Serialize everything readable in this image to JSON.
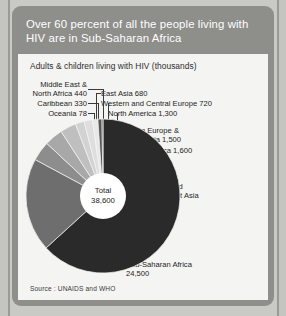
{
  "card": {
    "title": "Over 60 percent of all the people living with HIV are in Sub-Saharan Africa",
    "subtitle": "Adults & children living with HIV (thousands)",
    "source": "Source : UNAIDS and WHO"
  },
  "center": {
    "total_label": "Total",
    "total_value": "38,600"
  },
  "labels": {
    "middle_east_north_africa": "Middle East &\nNorth Africa 440",
    "caribbean": "Caribbean 330",
    "oceania": "Oceania 78",
    "east_asia": "East Asia 680",
    "western_central_europe": "Western and Central Europe 720",
    "north_america": "North America 1,300",
    "eastern_europe_central_asia": "Eastern Europe &\nCentral Asia 1,500",
    "latin_america": "Latin America 1,600",
    "south_southeast_asia": "South and\nSoutheast Asia\n7,600",
    "sub_saharan_africa": "Sub-Saharan Africa\n24,500"
  },
  "colors": {
    "page_background": "#c9c9c6",
    "card_header": "#8e8e8b",
    "panel": "#f4f4f2",
    "header_text": "#ffffff",
    "body_text": "#1c1c1c",
    "hub": "#ffffff"
  },
  "chart_data": {
    "type": "pie",
    "title": "Over 60 percent of all the people living with HIV are in Sub-Saharan Africa",
    "subtitle": "Adults & children living with HIV (thousands)",
    "units": "thousands",
    "total": 38600,
    "total_label": "Total 38,600",
    "legend_position": "callout-labels",
    "start_angle_deg": -90,
    "direction": "clockwise",
    "categories": [
      "Sub-Saharan Africa",
      "South and Southeast Asia",
      "Latin America",
      "Eastern Europe & Central Asia",
      "North America",
      "Western and Central Europe",
      "East Asia",
      "Middle East & North Africa",
      "Caribbean",
      "Oceania"
    ],
    "values": [
      24500,
      7600,
      1600,
      1500,
      1300,
      720,
      680,
      440,
      330,
      78
    ],
    "value_labels": [
      "24,500",
      "7,600",
      "1,600",
      "1,500",
      "1,300",
      "720",
      "680",
      "440",
      "330",
      "78"
    ],
    "percentages": [
      63.5,
      19.7,
      4.1,
      3.9,
      3.4,
      1.9,
      1.8,
      1.1,
      0.9,
      0.2
    ],
    "slice_colors": [
      "#2a2a2a",
      "#6e6e6e",
      "#8d8d8d",
      "#a8a8a8",
      "#bfbfbf",
      "#d2d2d2",
      "#dedede",
      "#e8e8e8",
      "#555555",
      "#1f1f1f"
    ],
    "source": "Source : UNAIDS and WHO"
  }
}
